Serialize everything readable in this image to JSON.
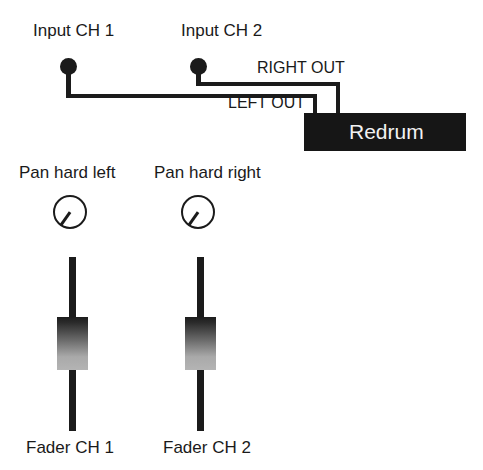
{
  "diagram": {
    "colors": {
      "ink": "#1b1b1b",
      "device_fill": "#161616",
      "device_text": "#f2f2f2",
      "background": "#ffffff"
    },
    "inputs": [
      {
        "id": "ch1",
        "label": "Input CH 1"
      },
      {
        "id": "ch2",
        "label": "Input CH 2"
      }
    ],
    "outputs": [
      {
        "id": "right",
        "label": "RIGHT OUT"
      },
      {
        "id": "left",
        "label": "LEFT OUT"
      }
    ],
    "device": {
      "name": "Redrum"
    },
    "pans": [
      {
        "id": "pan1",
        "label": "Pan hard left",
        "position": "hard left"
      },
      {
        "id": "pan2",
        "label": "Pan hard right",
        "position": "hard right"
      }
    ],
    "faders": [
      {
        "id": "fader1",
        "label": "Fader CH 1"
      },
      {
        "id": "fader2",
        "label": "Fader CH 2"
      }
    ]
  }
}
